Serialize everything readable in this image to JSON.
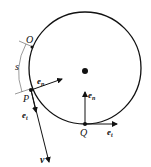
{
  "diagram": {
    "labels": {
      "O": "O",
      "s": "s",
      "P": "P",
      "Q": "Q",
      "v": "v",
      "e": "e",
      "n_sub": "n",
      "t_sub": "t"
    },
    "colors": {
      "stroke": "#111111",
      "arc": "#555555"
    }
  }
}
